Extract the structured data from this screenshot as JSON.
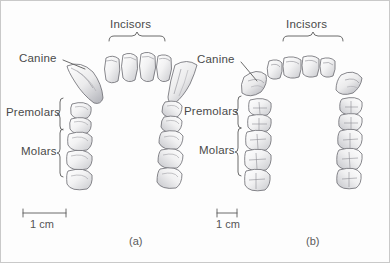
{
  "figure": {
    "background_color": "#fdfdfd",
    "border_color": "#c9c9c9",
    "ink_color": "#4a4a4a"
  },
  "panels": [
    {
      "id": "a",
      "caption": "(a)",
      "arch_type": "U-shaped ape dental arcade",
      "labels": {
        "incisors": "Incisors",
        "canine": "Canine",
        "premolars": "Premolars",
        "molars": "Molars"
      },
      "scale_bar": {
        "label": "1 cm",
        "length_px": 43
      },
      "teeth_counts": {
        "incisors": 4,
        "canines": 2,
        "premolars_per_side": 2,
        "molars_per_side": 3
      }
    },
    {
      "id": "b",
      "caption": "(b)",
      "arch_type": "Parabolic hominin dental arcade",
      "labels": {
        "incisors": "Incisors",
        "canine": "Canine",
        "premolars": "Premolars",
        "molars": "Molars"
      },
      "scale_bar": {
        "label": "1 cm",
        "length_px": 20
      },
      "teeth_counts": {
        "incisors": 4,
        "canines": 2,
        "premolars_per_side": 2,
        "molars_per_side": 3
      }
    }
  ]
}
